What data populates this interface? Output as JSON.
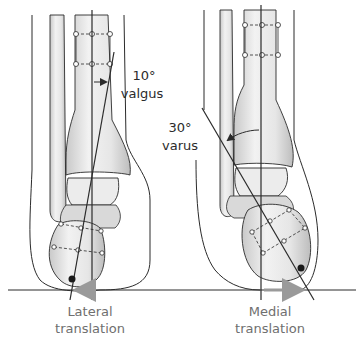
{
  "figure": {
    "panels": [
      {
        "id": "left",
        "angle_label": "10°",
        "deformity_label": "valgus",
        "translation_line1": "Lateral",
        "translation_line2": "translation"
      },
      {
        "id": "right",
        "angle_label": "30°",
        "deformity_label": "varus",
        "translation_line1": "Medial",
        "translation_line2": "translation"
      }
    ],
    "colors": {
      "outline": "#2b2b2b",
      "bone_fill": "#e6e6e6",
      "bone_shade": "#b8b8b8",
      "arrow_translation": "#9a9a9a",
      "label_gray": "#6f6f6f"
    }
  }
}
